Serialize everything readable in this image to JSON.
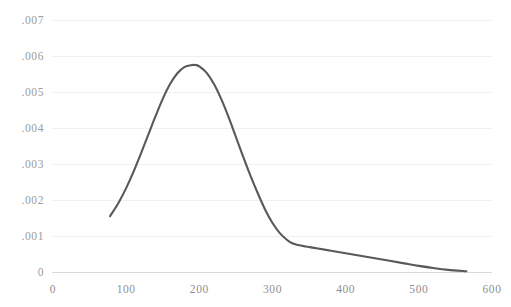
{
  "chart_data": {
    "type": "line",
    "title": "",
    "xlabel": "",
    "ylabel": "",
    "xlim": [
      0,
      600
    ],
    "ylim": [
      0,
      0.007
    ],
    "grid": true,
    "grid_axis": "y",
    "legend": false,
    "legend_position": "none",
    "series_color": "#595959",
    "grid_color": "#f0f0f0",
    "axis_color": "#d9d9d9",
    "tick_label_color": "#8f8f8f",
    "background_color": "#ffffff",
    "x_ticks": [
      {
        "value": 0,
        "label": "0"
      },
      {
        "value": 100,
        "label": "100"
      },
      {
        "value": 200,
        "label": "200"
      },
      {
        "value": 300,
        "label": "300"
      },
      {
        "value": 400,
        "label": "400"
      },
      {
        "value": 500,
        "label": "500"
      },
      {
        "value": 600,
        "label": "600"
      }
    ],
    "y_ticks": [
      {
        "value": 0.007,
        "label": ".007"
      },
      {
        "value": 0.006,
        "label": ".006"
      },
      {
        "value": 0.005,
        "label": ".005"
      },
      {
        "value": 0.004,
        "label": ".004"
      },
      {
        "value": 0.003,
        "label": ".003"
      },
      {
        "value": 0.002,
        "label": ".002"
      },
      {
        "value": 0.001,
        "label": ".001"
      },
      {
        "value": 0,
        "label": "0"
      }
    ],
    "series": [
      {
        "name": "density",
        "color": "#595959",
        "line_width": 2.1,
        "x": [
          78,
          90,
          100,
          110,
          120,
          130,
          140,
          150,
          160,
          170,
          180,
          190,
          195,
          200,
          210,
          220,
          230,
          240,
          250,
          260,
          270,
          280,
          290,
          300,
          310,
          320,
          327,
          335,
          345,
          360,
          380,
          400,
          420,
          440,
          460,
          480,
          500,
          520,
          540,
          565
        ],
        "y": [
          0.00155,
          0.00194,
          0.00233,
          0.00278,
          0.00328,
          0.0038,
          0.00432,
          0.00481,
          0.00522,
          0.00552,
          0.0057,
          0.00575,
          0.00575,
          0.00571,
          0.00553,
          0.00522,
          0.0048,
          0.0043,
          0.00375,
          0.0032,
          0.00267,
          0.00218,
          0.00173,
          0.00136,
          0.00108,
          0.00089,
          0.0008,
          0.00075,
          0.00071,
          0.00066,
          0.00059,
          0.00052,
          0.00045,
          0.00038,
          0.00031,
          0.00024,
          0.00017,
          0.00011,
          6e-05,
          2e-05
        ]
      }
    ],
    "annotations": []
  }
}
